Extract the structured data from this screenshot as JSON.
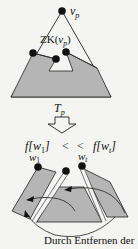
{
  "diagram": {
    "top_tree": {
      "root_label": "v_p",
      "root_label_main": "v",
      "root_label_sub": "p",
      "cut_label_prefix": "ZK(",
      "cut_label_var": "v",
      "cut_label_sub": "p",
      "cut_label_suffix": ")",
      "tree_label_main": "T",
      "tree_label_sub": "p"
    },
    "inequality": {
      "left_f": "f[",
      "left_var": "w",
      "left_sub": "1",
      "left_close": "]",
      "lt1": "<",
      "lt2": "<",
      "right_f": "f[",
      "right_var": "w",
      "right_sub": "t",
      "right_close": "]"
    },
    "bottom_nodes": {
      "left_main": "w",
      "left_sub": "1",
      "right_main": "w",
      "right_sub": "t"
    },
    "colors": {
      "fill": "#b5b5b5",
      "stroke": "#222222",
      "node": "#111111",
      "background": "#f4f4f2"
    }
  },
  "caption": "Durch Entfernen der"
}
